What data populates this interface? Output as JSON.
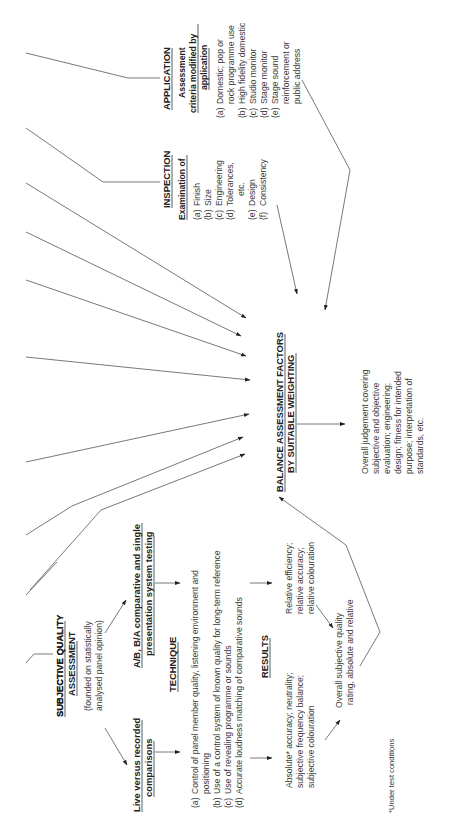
{
  "application": {
    "heading": "APPLICATION",
    "subheading_lines": [
      "Assessment",
      "criteria modified by",
      "application"
    ],
    "items": [
      {
        "marker": "(a)",
        "lines": [
          "Domestic; pop or",
          "rock programme use"
        ]
      },
      {
        "marker": "(b)",
        "lines": [
          "High fidelity domestic"
        ]
      },
      {
        "marker": "(c)",
        "lines": [
          "Studio monitor"
        ]
      },
      {
        "marker": "(d)",
        "lines": [
          "Stage monitor"
        ]
      },
      {
        "marker": "(e)",
        "lines": [
          "Stage sound",
          "reinforcement or",
          "public address"
        ]
      }
    ]
  },
  "inspection": {
    "heading": "INSPECTION",
    "subheading": "Examination of",
    "items": [
      {
        "marker": "(a)",
        "lines": [
          "Finish"
        ]
      },
      {
        "marker": "(b)",
        "lines": [
          "Size"
        ]
      },
      {
        "marker": "(c)",
        "lines": [
          "Engineering"
        ]
      },
      {
        "marker": "(d)",
        "lines": [
          "Tolerances,",
          "etc."
        ]
      },
      {
        "marker": "(e)",
        "lines": [
          "Design"
        ]
      },
      {
        "marker": "(f)",
        "lines": [
          "Consistency"
        ]
      }
    ]
  },
  "balance": {
    "lines": [
      "BALANCE ASSESSMENT FACTORS",
      "BY SUITABLE WEIGHTING"
    ]
  },
  "overall_judgement": {
    "lines": [
      "Overall judgement covering",
      "subjective and objective",
      "evaluation; engineering;",
      "design; fitness for intended",
      "purpose; interpretation of",
      "standards, etc."
    ]
  },
  "subjective": {
    "heading_lines": [
      "SUBJECTIVE QUALITY",
      "ASSESSMENT"
    ],
    "note_lines": [
      "(founded on statistically",
      "analysed panel opinion)"
    ]
  },
  "live_vs_recorded": {
    "lines": [
      "Live versus recorded",
      "comparisons"
    ]
  },
  "ab_testing": {
    "lines": [
      "A/B, B/A comparative and single",
      "presentation system testing"
    ]
  },
  "technique": {
    "heading": "TECHNIQUE",
    "items": [
      {
        "marker": "(a)",
        "lines": [
          "Control of panel member quality, listening environment and",
          "positioning"
        ]
      },
      {
        "marker": "(b)",
        "lines": [
          "Use of a control system of known quality for long-term reference"
        ]
      },
      {
        "marker": "(c)",
        "lines": [
          "Use of revealing programme or sounds"
        ]
      },
      {
        "marker": "(d)",
        "lines": [
          "Accurate loudness matching of comparative sounds"
        ]
      }
    ]
  },
  "results": {
    "heading": "RESULTS",
    "absolute_lines": [
      "Absolute* accuracy; neutrality;",
      "subjective frequency balance;",
      "subjective colouration"
    ],
    "relative_lines": [
      "Relative efficiency;",
      "relative accuracy;",
      "relative colouration"
    ],
    "overall_lines": [
      "Overall subjective quality",
      "rating, absolute and relative"
    ]
  },
  "footnote": "*Under test conditions"
}
